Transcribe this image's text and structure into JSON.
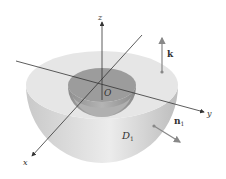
{
  "diagram": {
    "labels": {
      "z_axis": "z",
      "y_axis": "y",
      "x_axis": "x",
      "origin": "O",
      "region": "D",
      "region_subscript": "1",
      "top_normal": "k",
      "outer_normal": "n",
      "outer_normal_subscript": "1"
    },
    "colors": {
      "outer_shell_top": "#e4e4e4",
      "outer_shell_side": "#d2d2d2",
      "inner_bowl": "#a8a8a8",
      "inner_bowl_dark": "#9a9a9a",
      "axis_line": "#333333",
      "vector": "#888888"
    }
  }
}
